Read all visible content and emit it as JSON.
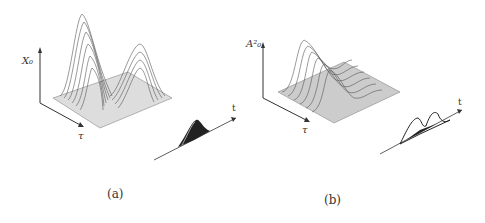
{
  "figure": {
    "panels": [
      {
        "id": "a",
        "caption": "(a)",
        "y_axis_label": "X₀",
        "x_axis_label": "τ",
        "inset_axis_label": "t",
        "surface": "two-peak surface, tall front peak and smaller rear peak"
      },
      {
        "id": "b",
        "caption": "(b)",
        "y_axis_label": "A²₀",
        "x_axis_label": "τ",
        "inset_axis_label": "t",
        "surface": "ridge surface with central dip"
      }
    ]
  },
  "colors": {
    "ink": "#333333",
    "mesh": "#666666",
    "background": "#ffffff"
  }
}
